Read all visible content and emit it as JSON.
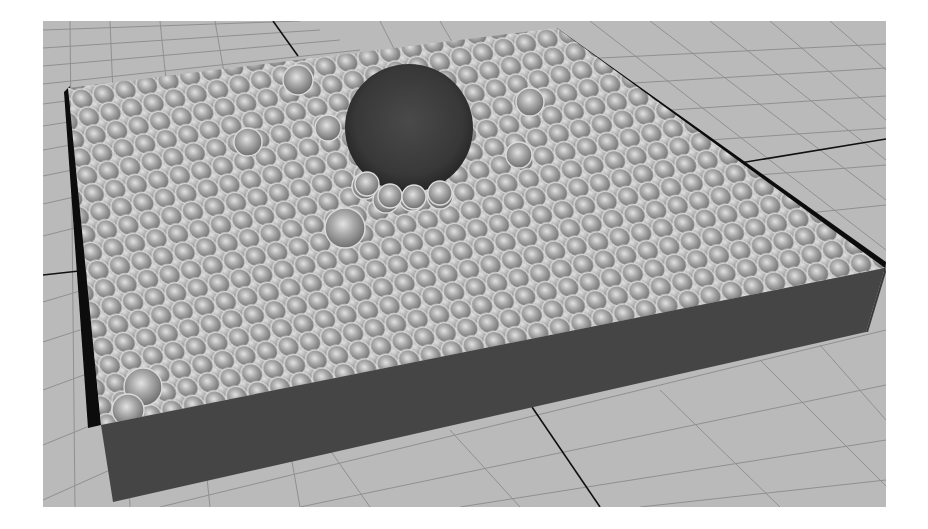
{
  "scene": {
    "description": "3D viewport render: rectangular tray filled with small spheres and one large dark sphere resting on top, over a perspective grid floor",
    "background_color": "#ffffff",
    "floor_color": "#b9b9b9",
    "grid_line_color": "#8e8e8e",
    "axis_line_color": "#111111",
    "tray_wall_color": "#444444",
    "tray_inner_shadow_color": "#0a0a0a",
    "small_sphere_fill": "#a8a8a8",
    "small_sphere_rim": "#d6d6d6",
    "large_sphere_color": "#3d3d3d",
    "objects": [
      {
        "name": "grid-floor"
      },
      {
        "name": "tray"
      },
      {
        "name": "particle-spheres"
      },
      {
        "name": "large-sphere"
      }
    ]
  }
}
